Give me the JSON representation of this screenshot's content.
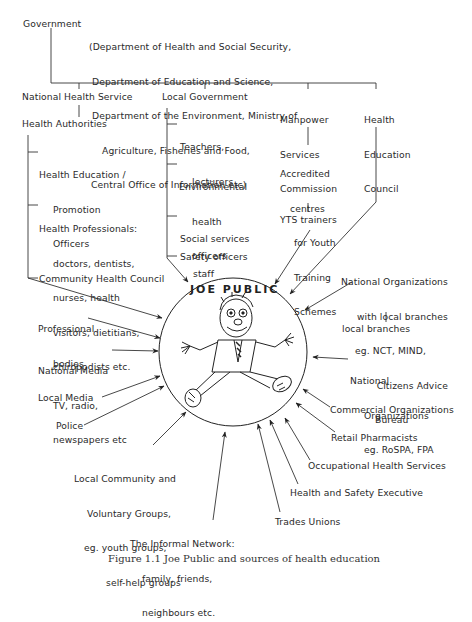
{
  "diagram": {
    "government": {
      "label": "Government",
      "departments": [
        "(Department of Health and Social Security,",
        "Department of Education and Science,",
        "Department of the Environment, Ministry of",
        "Agriculture, Fisheries and Food,",
        "Central Office of Information etc)"
      ]
    },
    "branches": {
      "nhs": {
        "label": "National Health Service",
        "authorities": "Health Authorities",
        "children": [
          [
            "Health Education /",
            "Promotion",
            "Officers"
          ],
          [
            "Health Professionals:",
            "doctors, dentists,",
            "nurses, health",
            "visitors, dietitians,",
            "chiropodists etc."
          ],
          [
            "Community Health Council"
          ]
        ]
      },
      "local_government": {
        "label": "Local Government",
        "children": [
          [
            "Teachers,",
            "lecturers"
          ],
          [
            "Environmental",
            "health",
            "officers"
          ],
          [
            "Social services",
            "staff"
          ],
          [
            "Safety officers"
          ]
        ]
      },
      "manpower": {
        "label": [
          "Manpower",
          "Services",
          "Commission"
        ],
        "children": [
          [
            "Accredited",
            "centres",
            "for Youth",
            "Training",
            "Schemes"
          ],
          [
            "YTS trainers"
          ]
        ]
      },
      "hec": {
        "label": [
          "Health",
          "Education",
          "Council"
        ]
      }
    },
    "center": {
      "title": "JOE PUBLIC",
      "figure": "cartoon-person"
    },
    "influences_left": [
      [
        "Professional",
        "bodies"
      ],
      [
        "National Media",
        "TV, radio,",
        "newspapers etc"
      ],
      [
        "Local Media"
      ],
      [
        "Police"
      ],
      [
        "Local Community and",
        "Voluntary Groups,",
        "eg. youth groups,",
        "self-help groups"
      ],
      [
        "The Informal Network:",
        "family, friends,",
        "neighbours etc."
      ]
    ],
    "influences_right": [
      [
        "National Organizations",
        "with local branches",
        "eg. NCT, MIND,",
        "Citizens Advice",
        "Bureau"
      ],
      [
        "local branches"
      ],
      [
        "National",
        "Organizations",
        "eg. RoSPA, FPA"
      ],
      [
        "Commercial Organizations"
      ],
      [
        "Retail Pharmacists"
      ],
      [
        "Occupational Health Services"
      ],
      [
        "Health and Safety Executive"
      ],
      [
        "Trades Unions"
      ]
    ],
    "caption": "Figure 1.1  Joe Public and sources of health education"
  }
}
